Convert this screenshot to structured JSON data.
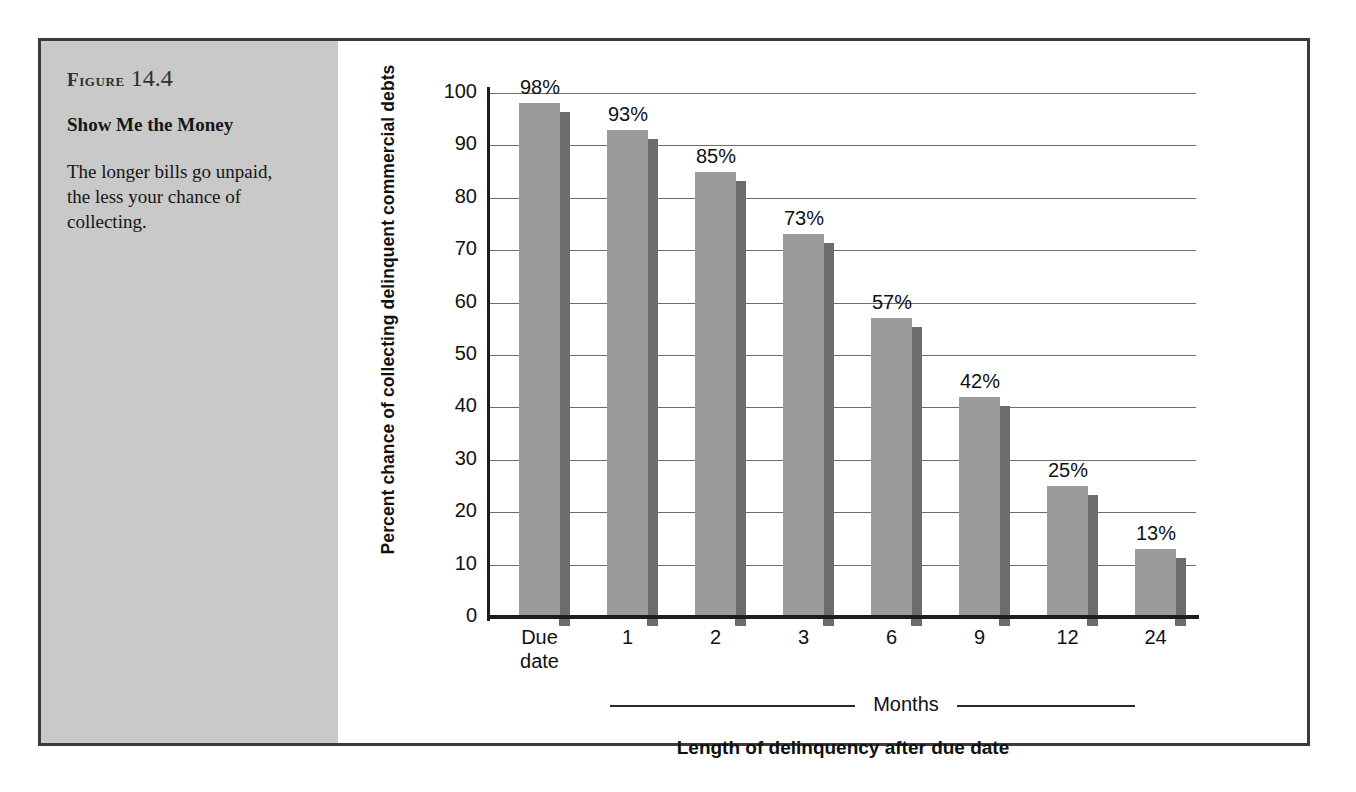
{
  "figure": {
    "number_word": "Figure",
    "number_value": "14.4",
    "headline": "Show Me the Money",
    "description": "The longer bills go unpaid, the less your chance of collecting."
  },
  "colors": {
    "panel_background": "#c9c9c9",
    "frame_border": "#3b3b3b",
    "bar_face": "#9b9b9b",
    "bar_shadow": "#6c6c6c",
    "gridline": "#6e6e6e",
    "axis": "#1d1d1d",
    "text": "#111111"
  },
  "chart_data": {
    "type": "bar",
    "title": "Show Me the Money",
    "subtitle": "The longer bills go unpaid, the less your chance of collecting.",
    "categories": [
      "Due date",
      "1",
      "2",
      "3",
      "6",
      "9",
      "12",
      "24"
    ],
    "values": [
      98,
      93,
      85,
      73,
      57,
      42,
      25,
      13
    ],
    "value_labels": [
      "98%",
      "93%",
      "85%",
      "73%",
      "57%",
      "42%",
      "25%",
      "13%"
    ],
    "xlabel": "Length of delinquency after due date",
    "ylabel": "Percent chance of collecting  delinquent commercial debts",
    "ylim": [
      0,
      100
    ],
    "yticks": [
      0,
      10,
      20,
      30,
      40,
      50,
      60,
      70,
      80,
      90,
      100
    ],
    "ytick_labels": [
      "0",
      "10",
      "20",
      "30",
      "40",
      "50",
      "60",
      "70",
      "80",
      "90",
      "100"
    ],
    "grid": true,
    "legend": null,
    "group_bracket_label": "Months",
    "annotations": [
      "Bracket labelled 'Months' spans the categories 1 through 24",
      "First category 'Due date' is excluded from the Months bracket"
    ]
  },
  "axis": {
    "x_title": "Length of delinquency after due date",
    "y_title": "Percent chance of collecting  delinquent commercial debts",
    "months_label": "Months"
  }
}
